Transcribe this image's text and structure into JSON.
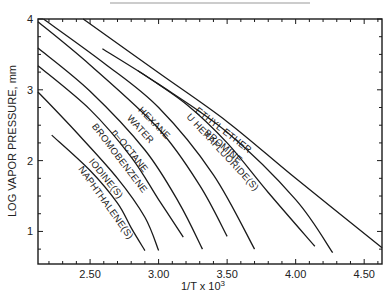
{
  "chart_data": {
    "type": "line",
    "title": "",
    "xlabel": "1/T x 10",
    "xlabel_superscript": "3",
    "ylabel": "LOG VAPOR PRESSURE, mm",
    "xlim": [
      2.12,
      4.63
    ],
    "ylim": [
      0.54,
      4.0
    ],
    "x_ticks": [
      2.5,
      3.0,
      3.5,
      4.0,
      4.5
    ],
    "x_tick_labels": [
      "2.50",
      "3.00",
      "3.50",
      "4.00",
      "4.50"
    ],
    "x_minor_step": 0.1,
    "y_ticks": [
      1,
      2,
      3,
      4
    ],
    "y_tick_labels": [
      "1",
      "2",
      "3",
      "4"
    ],
    "y_minor_step": 0.25,
    "grid": false,
    "legend": "inline labels",
    "series": [
      {
        "name": "ETHYL ETHER",
        "x": [
          2.45,
          3.0,
          3.5,
          4.0,
          4.63
        ],
        "y": [
          4.0,
          3.24,
          2.55,
          1.75,
          0.77
        ]
      },
      {
        "name": "BROMINE",
        "x": [
          2.59,
          3.0,
          3.5,
          4.0,
          4.27
        ],
        "y": [
          3.58,
          3.08,
          2.4,
          1.45,
          0.7
        ]
      },
      {
        "name": "U HEXAFLUORIDE(S)",
        "x": [
          2.85,
          3.2,
          3.5,
          3.8,
          4.14
        ],
        "y": [
          3.27,
          2.8,
          2.25,
          1.55,
          0.79
        ]
      },
      {
        "name": "HEXANE",
        "x": [
          2.16,
          2.6,
          3.0,
          3.4,
          3.7
        ],
        "y": [
          4.0,
          3.38,
          2.75,
          1.8,
          0.75
        ]
      },
      {
        "name": "WATER",
        "x": [
          2.12,
          2.5,
          3.0,
          3.3,
          3.5
        ],
        "y": [
          3.96,
          3.35,
          2.45,
          1.65,
          0.93
        ]
      },
      {
        "name": "n-OCTANE",
        "x": [
          2.12,
          2.5,
          2.9,
          3.15,
          3.32
        ],
        "y": [
          3.59,
          2.98,
          2.15,
          1.4,
          0.75
        ]
      },
      {
        "name": "BROMOBENZENE",
        "x": [
          2.12,
          2.5,
          2.8,
          3.0,
          3.18
        ],
        "y": [
          3.34,
          2.72,
          2.05,
          1.45,
          0.92
        ]
      },
      {
        "name": "IODINE(S)",
        "x": [
          2.12,
          2.4,
          2.7,
          2.9,
          3.0
        ],
        "y": [
          2.97,
          2.4,
          1.75,
          1.2,
          0.73
        ]
      },
      {
        "name": "NAPHTHALENE(S)",
        "x": [
          2.22,
          2.5,
          2.7,
          2.8,
          2.9
        ],
        "y": [
          2.36,
          1.86,
          1.4,
          1.05,
          0.73
        ]
      }
    ],
    "labels": [
      {
        "series": "ETHYL ETHER",
        "text": "ETHYL ETHER"
      },
      {
        "series": "BROMINE",
        "text": "BROMINE"
      },
      {
        "series": "U HEXAFLUORIDE(S)",
        "text": "U HEXAFLUORIDE(S)"
      },
      {
        "series": "HEXANE",
        "text": "HEXANE"
      },
      {
        "series": "WATER",
        "text": "WATER"
      },
      {
        "series": "n-OCTANE",
        "text": "n–OCTANE"
      },
      {
        "series": "BROMOBENZENE",
        "text": "BROMOBENZENE"
      },
      {
        "series": "IODINE(S)",
        "text": "IODINE(S)"
      },
      {
        "series": "NAPHTHALENE(S)",
        "text": "NAPHTHALENE(S)"
      }
    ]
  }
}
